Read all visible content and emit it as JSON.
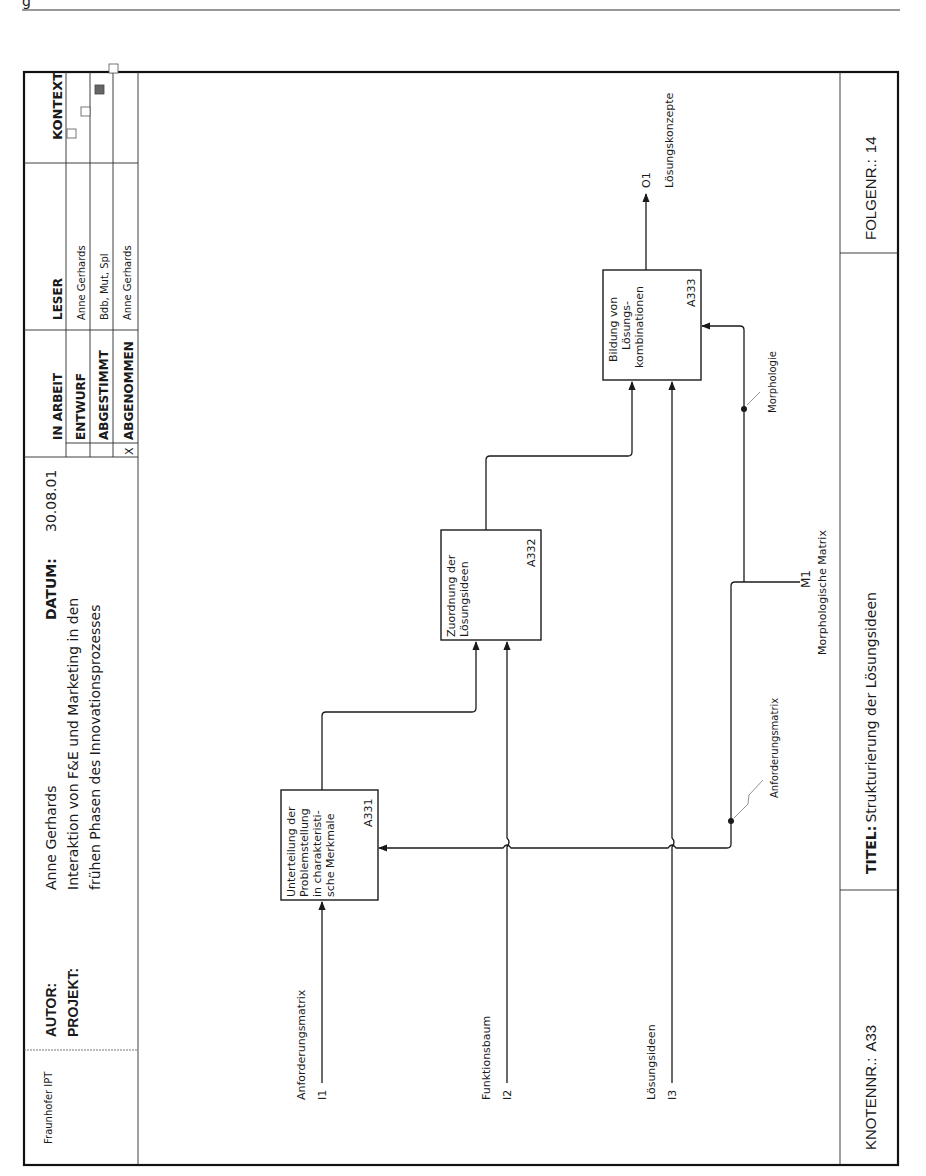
{
  "page_header": {
    "running_head": "g"
  },
  "form": {
    "organization": "Fraunhofer IPT",
    "author_label": "AUTOR:",
    "author": "Anne Gerhards",
    "project_label": "PROJEKT:",
    "project_line1": "Interaktion von F&E und Marketing in den",
    "project_line2": "frühen Phasen des Innovationsprozesses",
    "date_label": "DATUM:",
    "date": "30.08.01",
    "status": [
      {
        "label": "IN ARBEIT",
        "mark": ""
      },
      {
        "label": "ENTWURF",
        "mark": ""
      },
      {
        "label": "ABGESTIMMT",
        "mark": ""
      },
      {
        "label": "ABGENOMMEN",
        "mark": "X"
      }
    ],
    "reader_label": "LESER",
    "readers": [
      "Anne Gerhards",
      "Bdb, Mut, Spl",
      "Anne Gerhards"
    ],
    "context_label": "KONTEXT",
    "context_boxes": [
      {
        "filled": false
      },
      {
        "filled": false
      },
      {
        "filled": true
      },
      {
        "filled": false
      }
    ]
  },
  "footer": {
    "node_label": "KNOTENNR.:",
    "node_value": "A33",
    "title_label": "TITEL:",
    "title_value": "Strukturierung der Lösungsideen",
    "sequence_label": "FOLGENR.:",
    "sequence_value": "14"
  },
  "activities": [
    {
      "id": "A331",
      "line1": "Unterteilung der",
      "line2": "Problemstellung",
      "line3": "in charakteristi-",
      "line4": "sche Merkmale"
    },
    {
      "id": "A332",
      "line1": "Zuordnung der",
      "line2": "Lösungsideen"
    },
    {
      "id": "A333",
      "line1": "Bildung von",
      "line2": "Lösungs-",
      "line3": "kombinationen"
    }
  ],
  "inputs": [
    {
      "code": "I1",
      "label": "Anforderungsmatrix"
    },
    {
      "code": "I2",
      "label": "Funktionsbaum"
    },
    {
      "code": "I3",
      "label": "Lösungsideen"
    }
  ],
  "outputs": [
    {
      "code": "O1",
      "label": "Lösungskonzepte"
    }
  ],
  "mechanisms": [
    {
      "code": "M1",
      "label": "Morphologische Matrix"
    }
  ],
  "arrow_labels": {
    "anforderungsmatrix_branch": "Anforderungsmatrix",
    "morphologie_branch": "Morphologie"
  }
}
